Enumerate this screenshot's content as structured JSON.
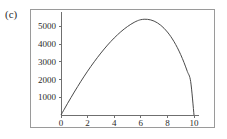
{
  "panel": {
    "label": "(c)"
  },
  "chart_data": {
    "type": "line",
    "title": "",
    "subtitle": "",
    "xlabel": "",
    "ylabel": "",
    "xlim": [
      0,
      10.4
    ],
    "ylim": [
      0,
      5800
    ],
    "xticks": [
      0,
      2,
      4,
      6,
      8,
      10
    ],
    "xticklabels": [
      "0",
      "2",
      "4",
      "6",
      "8",
      "10"
    ],
    "yticks": [
      1000,
      2000,
      3000,
      4000,
      5000
    ],
    "yticklabels": [
      "1000",
      "2000",
      "3000",
      "4000",
      "5000"
    ],
    "grid": false,
    "legend": null,
    "legend_position": "none",
    "annotations": [],
    "series": [
      {
        "name": "curve",
        "color": "#4a4a4a",
        "x": [
          0,
          0.25,
          0.5,
          0.75,
          1,
          1.25,
          1.5,
          1.75,
          2,
          2.25,
          2.5,
          2.75,
          3,
          3.25,
          3.5,
          3.75,
          4,
          4.25,
          4.5,
          4.75,
          5,
          5.25,
          5.5,
          5.75,
          5.9,
          6,
          6.25,
          6.5,
          6.75,
          7,
          7.25,
          7.5,
          7.75,
          8,
          8.25,
          8.5,
          8.75,
          9,
          9.25,
          9.5,
          9.75,
          10
        ],
        "values": [
          0,
          330,
          660,
          980,
          1295,
          1600,
          1900,
          2190,
          2470,
          2740,
          3000,
          3250,
          3490,
          3720,
          3940,
          4145,
          4340,
          4520,
          4690,
          4845,
          4985,
          5110,
          5220,
          5310,
          5350,
          5370,
          5395,
          5390,
          5355,
          5290,
          5190,
          5055,
          4885,
          4675,
          4425,
          4130,
          3790,
          3400,
          2955,
          2450,
          1880,
          0
        ]
      }
    ]
  },
  "axes": {
    "y_axis_name": "y-axis",
    "x_axis_name": "x-axis"
  },
  "colors": {
    "curve": "#4a4a4a",
    "axis": "#6f6f6f",
    "frame": "#9a9a9a",
    "text": "#2b2b2b",
    "background": "#ffffff"
  }
}
